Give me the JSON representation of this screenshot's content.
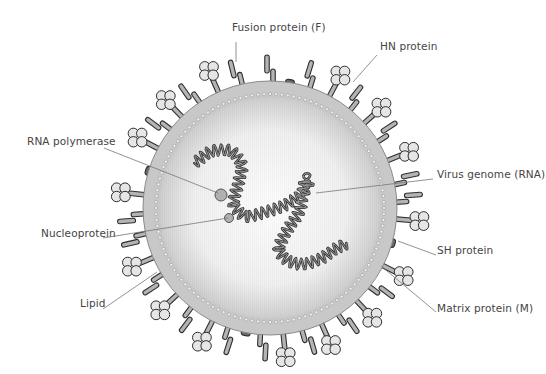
{
  "diagram": {
    "center": [
      270,
      208
    ],
    "outer_radius": 127,
    "membrane_inner_radius": 114,
    "core_radius": 110,
    "colors": {
      "envelope": "#c8c8c8",
      "envelope_stroke": "#8a8a8a",
      "core_light": "#fafafa",
      "core_dark": "#d8d8d8",
      "protein_fill": "#b4b4b4",
      "protein_stroke": "#2e2e2e",
      "sh_fill": "#6a6a6a",
      "hn_ball": "#e6e6e6",
      "genome": "#555555",
      "leader": "#777777"
    }
  },
  "labels": [
    {
      "id": "fusion",
      "text": "Fusion protein (F)",
      "x": 232,
      "y": 27,
      "align": "left",
      "line": [
        [
          236,
          42
        ],
        [
          236,
          62
        ]
      ]
    },
    {
      "id": "hn",
      "text": "HN protein",
      "x": 380,
      "y": 46,
      "align": "left",
      "line": [
        [
          377,
          55
        ],
        [
          353,
          82
        ]
      ]
    },
    {
      "id": "rna-pol",
      "text": "RNA polymerase",
      "x": 27,
      "y": 141,
      "align": "left",
      "line": [
        [
          104,
          148
        ],
        [
          218,
          193
        ]
      ]
    },
    {
      "id": "genome",
      "text": "Virus genome (RNA)",
      "x": 437,
      "y": 174,
      "align": "left",
      "line": [
        [
          433,
          179
        ],
        [
          316,
          193
        ]
      ]
    },
    {
      "id": "nucleoprotein",
      "text": "Nucleoprotein",
      "x": 41,
      "y": 233,
      "align": "left",
      "line": [
        [
          103,
          238
        ],
        [
          228,
          218
        ]
      ]
    },
    {
      "id": "sh",
      "text": "SH protein",
      "x": 437,
      "y": 250,
      "align": "left",
      "line": [
        [
          436,
          255
        ],
        [
          398,
          241
        ]
      ]
    },
    {
      "id": "lipid",
      "text": "Lipid",
      "x": 80,
      "y": 303,
      "align": "left",
      "line": [
        [
          103,
          309
        ],
        [
          157,
          272
        ]
      ]
    },
    {
      "id": "matrix",
      "text": "Matrix protein (M)",
      "x": 437,
      "y": 308,
      "align": "left",
      "line": [
        [
          436,
          312
        ],
        [
          381,
          266
        ]
      ]
    }
  ],
  "components": {
    "rna_polymerase": {
      "x": 221,
      "y": 195,
      "r": 6
    },
    "nucleoprotein": {
      "x": 229,
      "y": 218,
      "r": 4.5
    },
    "genome_path": [
      [
        193,
        164
      ],
      [
        212,
        150
      ],
      [
        232,
        150
      ],
      [
        243,
        165
      ],
      [
        238,
        185
      ],
      [
        232,
        205
      ],
      [
        245,
        218
      ],
      [
        262,
        213
      ],
      [
        282,
        207
      ],
      [
        300,
        196
      ],
      [
        310,
        185
      ],
      [
        305,
        175
      ],
      [
        303,
        193
      ],
      [
        300,
        212
      ],
      [
        287,
        230
      ],
      [
        277,
        250
      ],
      [
        288,
        262
      ],
      [
        304,
        265
      ],
      [
        323,
        258
      ],
      [
        336,
        248
      ],
      [
        348,
        243
      ]
    ]
  },
  "surface_proteins": [
    {
      "type": "F",
      "angle": -90
    },
    {
      "type": "SH",
      "angle": -81
    },
    {
      "type": "F",
      "angle": -73
    },
    {
      "type": "HN",
      "angle": -62
    },
    {
      "type": "F",
      "angle": -52
    },
    {
      "type": "HN",
      "angle": -42
    },
    {
      "type": "F",
      "angle": -33
    },
    {
      "type": "HN",
      "angle": -22
    },
    {
      "type": "F",
      "angle": -12
    },
    {
      "type": "F",
      "angle": -4
    },
    {
      "type": "HN",
      "angle": 5
    },
    {
      "type": "SH",
      "angle": 16
    },
    {
      "type": "HN",
      "angle": 27
    },
    {
      "type": "F",
      "angle": 37
    },
    {
      "type": "HN",
      "angle": 47
    },
    {
      "type": "F",
      "angle": 56
    },
    {
      "type": "HN",
      "angle": 66
    },
    {
      "type": "F",
      "angle": 74
    },
    {
      "type": "HN",
      "angle": 84
    },
    {
      "type": "F",
      "angle": 93
    },
    {
      "type": "SH",
      "angle": 101
    },
    {
      "type": "F",
      "angle": 108
    },
    {
      "type": "HN",
      "angle": 117
    },
    {
      "type": "F",
      "angle": 127
    },
    {
      "type": "HN",
      "angle": 137
    },
    {
      "type": "F",
      "angle": 147
    },
    {
      "type": "HN",
      "angle": 157
    },
    {
      "type": "F",
      "angle": 167
    },
    {
      "type": "F",
      "angle": 176
    },
    {
      "type": "HN",
      "angle": 186
    },
    {
      "type": "SH",
      "angle": 197
    },
    {
      "type": "HN",
      "angle": 208
    },
    {
      "type": "F",
      "angle": 217
    },
    {
      "type": "HN",
      "angle": 226
    },
    {
      "type": "F",
      "angle": 235
    },
    {
      "type": "HN",
      "angle": 246
    },
    {
      "type": "F",
      "angle": 256
    }
  ]
}
